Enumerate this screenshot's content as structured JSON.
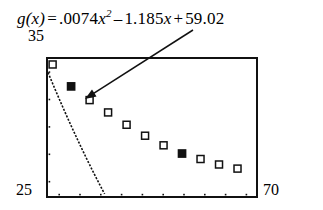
{
  "equation": {
    "lhs": "g(x)",
    "equals": "=",
    "coef_a": ".0074",
    "var_sq": "x",
    "exponent": "2",
    "op_b": "–",
    "coef_b": "1.185",
    "var_b": "x",
    "op_c": "+",
    "coef_c": "59.02",
    "full_text": "g(x) = .0074x² – 1.185x + 59.02"
  },
  "axes": {
    "ymax_label": "35",
    "xmin_label": "25",
    "xmax_label": "70",
    "x_tick_count": 10,
    "y_tick_count": 5
  },
  "colors": {
    "frame": "#111111",
    "curve": "#111111",
    "marker_open_fill": "#ffffff",
    "marker_filled": "#111111",
    "arrow": "#111111"
  },
  "annotation": {
    "arrow_name": "callout-arrow",
    "arrow_from_x": 193,
    "arrow_from_y": 30,
    "arrow_to_x": 85,
    "arrow_to_y": 99
  },
  "chart_data": {
    "type": "scatter",
    "title": "",
    "subtitle": "",
    "xlabel": "",
    "ylabel": "",
    "xlim": [
      25,
      70
    ],
    "ylim": [
      25,
      35
    ],
    "grid": false,
    "legend": null,
    "annotations": [
      {
        "text": "g(x) = .0074x² – 1.185x + 59.02",
        "points_to": "second data point"
      }
    ],
    "fit_curve": {
      "name": "g(x)",
      "form": "quadratic",
      "a": 0.0074,
      "b": -1.185,
      "c": 59.02
    },
    "series": [
      {
        "name": "data points",
        "marker": "square",
        "x": [
          26,
          30,
          34,
          38,
          42,
          46,
          50,
          54,
          58,
          62,
          66
        ],
        "y": [
          34.6,
          33.0,
          32.0,
          31.1,
          30.2,
          29.4,
          28.7,
          28.1,
          27.7,
          27.3,
          27.0
        ],
        "marker_styles": [
          "open",
          "filled",
          "open",
          "open",
          "open",
          "open",
          "open",
          "filled",
          "open",
          "open",
          "open"
        ]
      }
    ]
  }
}
